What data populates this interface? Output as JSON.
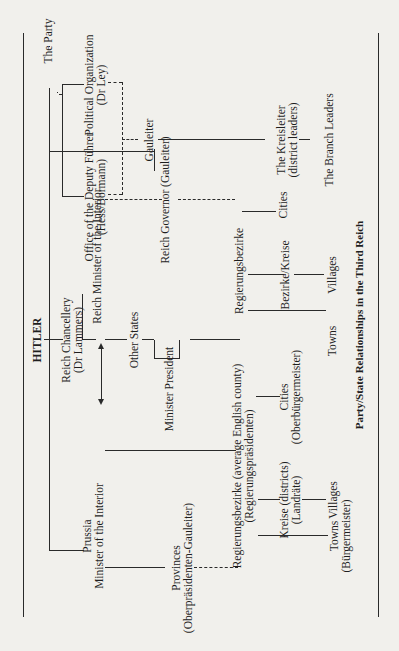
{
  "diagram": {
    "title": "HITLER",
    "caption": "Party/State Relationships in the Third Reich",
    "party": {
      "label": "The Party",
      "deputy": [
        "Office of the Deputy Führer",
        "(Hess/Bormann)"
      ],
      "political": [
        "Political Organization",
        "(Dr Ley)"
      ],
      "gauleiter": "Gauleiter",
      "kreisleiter": [
        "The Kreisleiter",
        "(district leaders)"
      ],
      "branch": "The Branch Leaders"
    },
    "state": {
      "chancellery": [
        "Reich Chancellery",
        "(Dr Lammers)"
      ],
      "interior": "Reich Minister of the Interior",
      "other_states": "Other States",
      "minister_president": "Minister President",
      "reich_governor": "Reich Governor (Gauleiter)",
      "regbez_other": "Regierungsbezirke",
      "bezirke_kreise": "Bezirke/Kreise",
      "cities_other": "Cities",
      "towns_other": "Towns",
      "villages_other": "Villages"
    },
    "prussia": {
      "minister": [
        "Prussia",
        "Minister of the Interior"
      ],
      "provinces": [
        "Provinces",
        "(Oberpräsidenten-Gauleiter)"
      ],
      "regbez": [
        "Regierungsbezirke (average English county)",
        "(Regierungspräsidenten)"
      ],
      "cities": [
        "Cities",
        "(Oberbürgermeister)"
      ],
      "kreise": [
        "Kreise (districts)",
        "(Landräte)"
      ],
      "towns": [
        "Towns",
        "(Bürgermeister)"
      ],
      "villages": "Villages"
    }
  }
}
